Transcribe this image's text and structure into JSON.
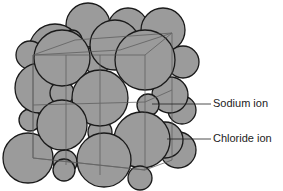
{
  "diagram": {
    "sphere_color": "#9b9b9b",
    "outline_color": "#1a1a1a",
    "labels": [
      {
        "text": "Sodium ion",
        "x": 213,
        "y": 98
      },
      {
        "text": "Chloride ion",
        "x": 213,
        "y": 133
      }
    ]
  }
}
